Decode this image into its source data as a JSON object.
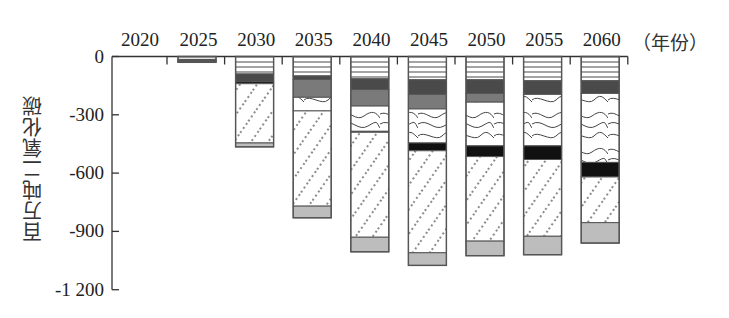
{
  "chart_data": {
    "type": "bar",
    "stacked": true,
    "title": "",
    "xlabel": "（年份）",
    "ylabel": "百万吨二氧化碳",
    "ylim": [
      -1200,
      0
    ],
    "yticks": [
      0,
      -300,
      -600,
      -900,
      -1200
    ],
    "ytick_labels": [
      "0",
      "-300",
      "-600",
      "-900",
      "-1 200"
    ],
    "x_axis_position": "top",
    "grid": false,
    "legend": null,
    "categories": [
      "2020",
      "2025",
      "2030",
      "2035",
      "2040",
      "2045",
      "2050",
      "2055",
      "2060"
    ],
    "series": [
      {
        "name": "horizontal-stripes",
        "pattern": "hlines",
        "values": [
          0,
          -15,
          -90,
          -100,
          -115,
          -120,
          -120,
          -125,
          -125
        ]
      },
      {
        "name": "dark-grey",
        "pattern": "dark",
        "values": [
          0,
          -5,
          -40,
          -18,
          -55,
          -75,
          -70,
          -70,
          -65
        ]
      },
      {
        "name": "medium-grey",
        "pattern": "grey",
        "values": [
          0,
          0,
          0,
          -92,
          -85,
          -75,
          -45,
          0,
          0
        ]
      },
      {
        "name": "contour",
        "pattern": "contour",
        "values": [
          0,
          0,
          0,
          -70,
          -130,
          -175,
          -225,
          -265,
          -355
        ]
      },
      {
        "name": "black",
        "pattern": "black",
        "values": [
          0,
          -5,
          -10,
          0,
          -5,
          -40,
          -55,
          -70,
          -75
        ]
      },
      {
        "name": "dotted-diagonal",
        "pattern": "dots",
        "values": [
          0,
          0,
          -305,
          -490,
          -540,
          -525,
          -435,
          -395,
          -235
        ]
      },
      {
        "name": "light-grey",
        "pattern": "light",
        "values": [
          0,
          -5,
          -20,
          -60,
          -75,
          -65,
          -75,
          -95,
          -105
        ]
      }
    ],
    "totals": [
      0,
      -30,
      -465,
      -830,
      -1005,
      -1075,
      -1025,
      -1020,
      -960
    ]
  },
  "axis": {
    "y_tick_labels": [
      "0",
      "-300",
      "-600",
      "-900",
      "-1 200"
    ],
    "y_title": "百万吨二氧化碳",
    "x_unit": "（年份）"
  },
  "colors": {
    "axis": "#333333",
    "outline": "#555555",
    "dark": "#4a4a4a",
    "grey": "#7a7a7a",
    "black": "#111111",
    "light": "#bdbdbd",
    "stripe": "#666666",
    "dot": "#555555",
    "contour": "#444444"
  }
}
